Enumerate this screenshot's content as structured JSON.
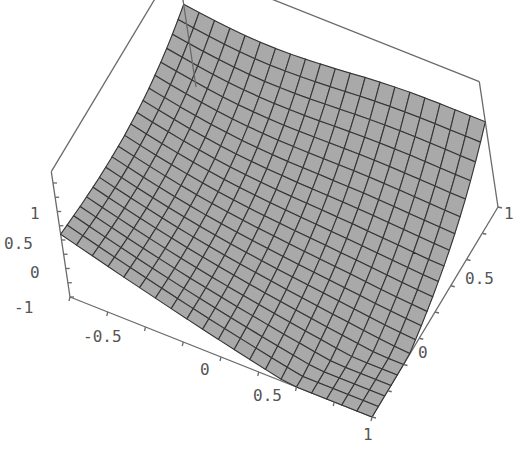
{
  "chart_data": {
    "type": "surface3d",
    "title": "",
    "xlabel": "",
    "ylabel": "",
    "zlabel": "",
    "x_range": [
      -1,
      1
    ],
    "y_range": [
      -1,
      1
    ],
    "z_range": [
      -1,
      1
    ],
    "grid_divisions": 20,
    "x_ticks": [
      "-0.5",
      "0",
      "0.5",
      "1"
    ],
    "y_ticks": [
      "0",
      "0.5",
      "1"
    ],
    "z_ticks": [
      "-1",
      "0",
      "0.5",
      "1"
    ],
    "surface_color": "#a9a9a9",
    "mesh_color": "#333333",
    "box_color": "#6a6a6a",
    "boxed": true
  },
  "labels": {
    "z": [
      {
        "text": "1",
        "x": 30,
        "y": 219
      },
      {
        "text": "0.5",
        "x": 4,
        "y": 249
      },
      {
        "text": "0",
        "x": 30,
        "y": 278
      },
      {
        "text": "-1",
        "x": 14,
        "y": 313
      }
    ],
    "x": [
      {
        "text": "-0.5",
        "x": 83,
        "y": 342
      },
      {
        "text": "0",
        "x": 200,
        "y": 375
      },
      {
        "text": "0.5",
        "x": 253,
        "y": 401
      },
      {
        "text": "1",
        "x": 363,
        "y": 440
      }
    ],
    "y": [
      {
        "text": "0",
        "x": 418,
        "y": 358
      },
      {
        "text": "0.5",
        "x": 465,
        "y": 284
      },
      {
        "text": "1",
        "x": 504,
        "y": 219
      }
    ]
  }
}
